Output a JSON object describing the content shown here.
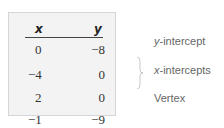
{
  "table": {
    "headers": {
      "x": "x",
      "y": "y"
    },
    "rows": [
      {
        "x": "0",
        "y": "−8"
      },
      {
        "x": "−4",
        "y": "0"
      },
      {
        "x": "2",
        "y": "0"
      },
      {
        "x": "−1",
        "y": "−9"
      }
    ]
  },
  "annotations": {
    "y_intercept": {
      "var": "y",
      "rest": "-intercept"
    },
    "x_intercepts": {
      "var": "x",
      "rest": "-intercepts"
    },
    "vertex": "Vertex"
  },
  "colors": {
    "table_background": "#f3f3f4",
    "table_border": "#d6d6d8",
    "annotation_text": "#666666"
  }
}
